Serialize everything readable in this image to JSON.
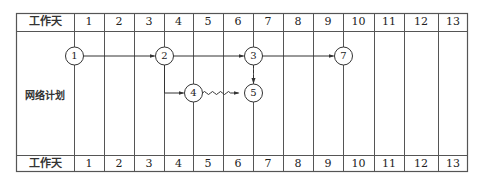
{
  "diagram": {
    "header_label": "工作天",
    "footer_label": "工作天",
    "row_label": "网络计划",
    "days": [
      "1",
      "2",
      "3",
      "4",
      "5",
      "6",
      "7",
      "8",
      "9",
      "10",
      "11",
      "12",
      "13"
    ],
    "nodes": [
      {
        "id": "1",
        "label": "1",
        "day": 1,
        "row": "top"
      },
      {
        "id": "2",
        "label": "2",
        "day": 4,
        "row": "top"
      },
      {
        "id": "3",
        "label": "3",
        "day": 7,
        "row": "top"
      },
      {
        "id": "4",
        "label": "4",
        "day": 5,
        "row": "bottom"
      },
      {
        "id": "5",
        "label": "5",
        "day": 7,
        "row": "bottom"
      },
      {
        "id": "7",
        "label": "7",
        "day": 10,
        "row": "top"
      }
    ],
    "edges": [
      {
        "from": "1",
        "to": "2",
        "type": "solid-arrow"
      },
      {
        "from": "2",
        "to": "3",
        "type": "solid-arrow"
      },
      {
        "from": "3",
        "to": "7",
        "type": "solid-arrow"
      },
      {
        "from": "2",
        "to": "4",
        "type": "solid-arrow-elbow"
      },
      {
        "from": "4",
        "to": "5",
        "type": "wavy-free-float-arrow"
      },
      {
        "from": "3",
        "to": "5",
        "type": "dashed-dummy-arrow"
      }
    ],
    "line_color": "#333333"
  }
}
